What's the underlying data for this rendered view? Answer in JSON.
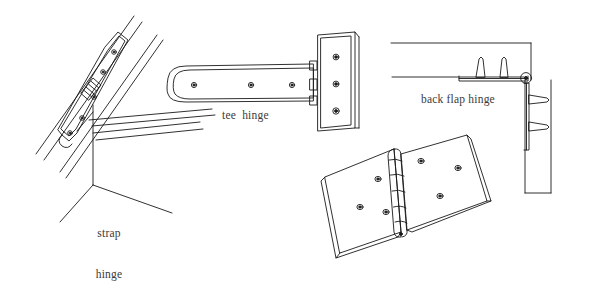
{
  "figure": {
    "background_color": "#ffffff",
    "stroke_color": "#1a1a1a",
    "label_color": "#3a3a3a",
    "width": 590,
    "height": 267
  },
  "labels": {
    "strap_hinge_line1": "strap",
    "strap_hinge_line2": "hinge",
    "tee_hinge": "tee  hinge",
    "back_flap_hinge": "back flap hinge"
  },
  "hinges": [
    {
      "id": "strap-hinge",
      "name": "strap hinge",
      "label": "strap hinge",
      "position": "left",
      "description": "Long tapered strap fixed diagonally across a gate brace and stile, with a knuckle barrel at the pivot.",
      "screw_holes": 5,
      "knuckle_segments": 5
    },
    {
      "id": "tee-hinge",
      "name": "tee hinge",
      "label": "tee  hinge",
      "position": "center-top",
      "description": "Horizontal tapered strap joined by three knuckles to a vertical rectangular plate.",
      "strap_screw_holes": 3,
      "plate_screw_holes": 3,
      "knuckle_segments": 3
    },
    {
      "id": "back-flap-hinge",
      "name": "back flap hinge",
      "label": "back flap hinge",
      "position": "right-top",
      "description": "Corner joint showing two leaves set into the face of boards with a pin knuckle at the corner.",
      "top_screws": 2,
      "side_screws": 2
    },
    {
      "id": "butt-hinge",
      "name": "butt hinge",
      "label": "",
      "position": "bottom-right",
      "description": "Open butt hinge in pictorial view, two rectangular leaves with a central knuckle column.",
      "left_leaf_screw_holes": 4,
      "right_leaf_screw_holes": 4,
      "knuckle_segments": 5
    }
  ]
}
